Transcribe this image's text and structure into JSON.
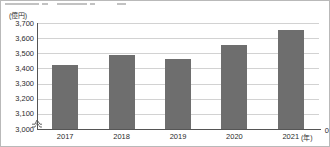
{
  "chart_data": {
    "type": "bar",
    "title": "",
    "xlabel": "(年)",
    "ylabel": "(億円)",
    "categories": [
      "2017",
      "2018",
      "2019",
      "2020",
      "2021"
    ],
    "values": [
      3425,
      3490,
      3465,
      3555,
      3655
    ],
    "ylim": [
      3000,
      3700
    ],
    "ytick_labels": [
      "3,700",
      "3,600",
      "3,500",
      "3,400",
      "3,300",
      "3,200",
      "3,100",
      "3,000"
    ],
    "ytick_values": [
      3700,
      3600,
      3500,
      3400,
      3300,
      3200,
      3100,
      3000
    ],
    "zero_label": "0",
    "axis_break": true,
    "grid": true,
    "legend": null,
    "bar_color": "#6e6e6e",
    "grid_color": "#d2d2d2",
    "axis_color": "#555555"
  }
}
